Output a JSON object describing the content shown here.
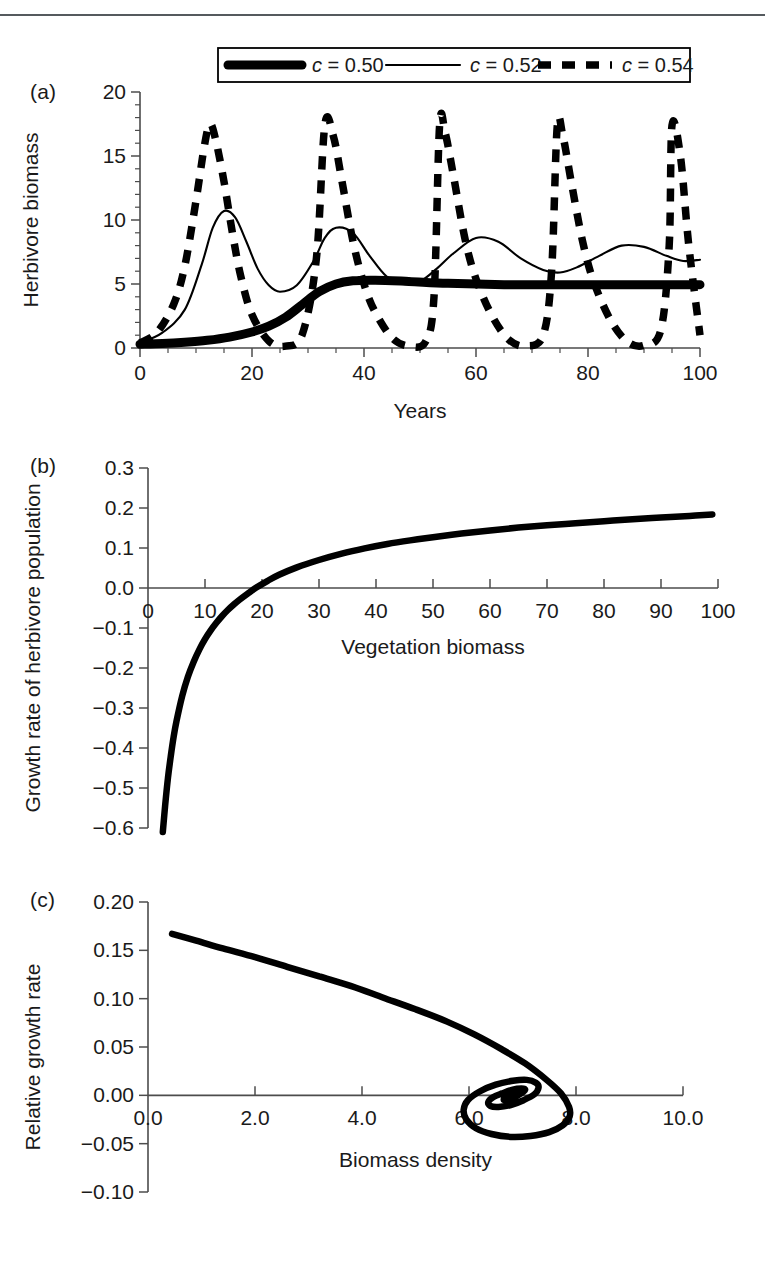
{
  "figure": {
    "panels": [
      {
        "key": "a",
        "label": "(a)"
      },
      {
        "key": "b",
        "label": "(b)"
      },
      {
        "key": "c",
        "label": "(c)"
      }
    ]
  },
  "chart_data": [
    {
      "panel": "(a)",
      "type": "line",
      "title": "",
      "xlabel": "Years",
      "ylabel": "Herbivore biomass",
      "xlim": [
        0,
        100
      ],
      "ylim": [
        0,
        20
      ],
      "xticks": [
        "0",
        "20",
        "40",
        "60",
        "80",
        "100"
      ],
      "xtick_values": [
        0,
        20,
        40,
        60,
        80,
        100
      ],
      "yticks": [
        "0",
        "5",
        "10",
        "15",
        "20"
      ],
      "ytick_values": [
        0,
        5,
        10,
        15,
        20
      ],
      "grid": false,
      "legend_position": "top-center",
      "legend": [
        {
          "label_prefix": "c",
          "label_rest": " = 0.50",
          "style": "thick-solid"
        },
        {
          "label_prefix": "c",
          "label_rest": " = 0.52",
          "style": "thin-solid"
        },
        {
          "label_prefix": "c",
          "label_rest": " = 0.54",
          "style": "dashed"
        }
      ],
      "series": [
        {
          "name": "c = 0.50",
          "style": "thick-solid",
          "description": "Monotone sigmoid rise to a stable equilibrium near 5",
          "x": [
            0,
            4,
            8,
            12,
            16,
            20,
            23,
            26,
            29,
            32,
            35,
            38,
            42,
            48,
            55,
            65,
            75,
            85,
            95,
            100
          ],
          "y": [
            0.3,
            0.35,
            0.45,
            0.6,
            0.85,
            1.25,
            1.7,
            2.4,
            3.4,
            4.4,
            5.0,
            5.25,
            5.3,
            5.2,
            5.05,
            4.95,
            4.95,
            4.95,
            4.95,
            4.95
          ]
        },
        {
          "name": "c = 0.52",
          "style": "thin-solid",
          "description": "Damped oscillation toward equilibrium near 7",
          "x": [
            0,
            4,
            8,
            11,
            13,
            15,
            17,
            19,
            21,
            23,
            25,
            28,
            31,
            33,
            35,
            38,
            41,
            44,
            47,
            50,
            53,
            56,
            60,
            64,
            68,
            72,
            75,
            78,
            82,
            86,
            90,
            94,
            97,
            100
          ],
          "y": [
            0.4,
            1.2,
            3.0,
            6.5,
            9.4,
            10.7,
            10.2,
            8.3,
            6.2,
            4.9,
            4.4,
            4.9,
            6.8,
            8.6,
            9.4,
            9.0,
            7.2,
            5.6,
            5.0,
            5.2,
            6.2,
            7.4,
            8.6,
            8.3,
            7.0,
            6.1,
            5.9,
            6.3,
            7.2,
            8.0,
            7.9,
            7.2,
            6.8,
            6.9
          ]
        },
        {
          "name": "c = 0.54",
          "style": "dashed",
          "description": "Sustained large-amplitude relaxation cycles, peaks near 17.5, troughs near 0, period about 21 years",
          "peaks_x": [
            12.5,
            33,
            53.5,
            74.5,
            95
          ],
          "peak_value": 17.5,
          "trough_value": 0.05,
          "period": 21,
          "x": [
            0,
            3,
            6,
            8,
            10,
            11.5,
            12.5,
            13.5,
            15,
            16.5,
            18,
            20,
            23,
            26,
            29,
            31.5,
            33,
            34.5,
            36,
            38,
            40,
            42,
            45,
            48,
            51,
            52.5,
            53.5,
            54.5,
            56,
            58,
            60,
            63,
            66,
            69,
            72,
            73.5,
            74.5,
            75.5,
            77,
            79,
            81,
            84,
            87,
            90,
            93,
            94.5,
            95,
            96.5,
            98,
            100
          ],
          "y": [
            0.4,
            1.2,
            3.4,
            6.4,
            11.5,
            15.8,
            17.5,
            16.3,
            13.0,
            9.0,
            5.6,
            2.6,
            0.55,
            0.15,
            1.1,
            7.0,
            17.4,
            16.6,
            13.2,
            8.4,
            5.0,
            2.8,
            0.8,
            0.15,
            0.5,
            4.0,
            17.4,
            16.8,
            13.4,
            8.6,
            5.4,
            2.4,
            0.6,
            0.15,
            1.0,
            6.0,
            17.3,
            16.6,
            13.0,
            8.4,
            5.2,
            2.2,
            0.5,
            0.2,
            1.4,
            8.0,
            17.4,
            15.0,
            8.0,
            1.0
          ]
        }
      ]
    },
    {
      "panel": "(b)",
      "type": "line",
      "title": "",
      "xlabel": "Vegetation biomass",
      "ylabel": "Growth rate of herbivore population",
      "xlim": [
        0,
        100
      ],
      "ylim": [
        -0.6,
        0.3
      ],
      "xticks": [
        "0",
        "10",
        "20",
        "30",
        "40",
        "50",
        "60",
        "70",
        "80",
        "90",
        "100"
      ],
      "xtick_values": [
        0,
        10,
        20,
        30,
        40,
        50,
        60,
        70,
        80,
        90,
        100
      ],
      "yticks": [
        "0.3",
        "0.2",
        "0.1",
        "0.0",
        "-0.1",
        "-0.2",
        "-0.3",
        "-0.4",
        "-0.5",
        "-0.6"
      ],
      "ytick_values": [
        0.3,
        0.2,
        0.1,
        0.0,
        -0.1,
        -0.2,
        -0.3,
        -0.4,
        -0.5,
        -0.6
      ],
      "grid": false,
      "zero_crossing_x": 17.5,
      "asymptote_y": 0.205,
      "series": [
        {
          "name": "Per-capita growth rate (saturating functional response minus mortality)",
          "style": "thick-solid",
          "x": [
            2.6,
            3,
            3.5,
            4,
            4.5,
            5,
            6,
            7,
            8,
            9,
            10,
            11,
            12,
            13,
            14,
            15,
            16,
            17.5,
            19,
            21,
            23,
            26,
            30,
            34,
            38,
            42,
            46,
            50,
            55,
            60,
            65,
            70,
            75,
            80,
            85,
            90,
            95,
            99
          ],
          "y": [
            -0.61,
            -0.545,
            -0.475,
            -0.42,
            -0.372,
            -0.333,
            -0.27,
            -0.222,
            -0.185,
            -0.154,
            -0.128,
            -0.106,
            -0.087,
            -0.07,
            -0.055,
            -0.042,
            -0.03,
            -0.014,
            0.001,
            0.018,
            0.033,
            0.051,
            0.07,
            0.086,
            0.099,
            0.11,
            0.119,
            0.127,
            0.136,
            0.144,
            0.151,
            0.157,
            0.162,
            0.167,
            0.172,
            0.176,
            0.18,
            0.184
          ]
        }
      ]
    },
    {
      "panel": "(c)",
      "type": "line",
      "title": "",
      "xlabel": "Biomass density",
      "ylabel": "Relative growth rate",
      "xlim": [
        0,
        10
      ],
      "ylim": [
        -0.1,
        0.2
      ],
      "xticks": [
        "0.0",
        "2.0",
        "4.0",
        "6.0",
        "8.0",
        "10.0"
      ],
      "xtick_values": [
        0,
        2,
        4,
        6,
        8,
        10
      ],
      "yticks": [
        "0.20",
        "0.15",
        "0.10",
        "0.05",
        "0.00",
        "-0.05",
        "-0.10"
      ],
      "ytick_values": [
        0.2,
        0.15,
        0.1,
        0.05,
        0.0,
        -0.05,
        -0.1
      ],
      "grid": false,
      "equilibrium_point": [
        6.85,
        0.0
      ],
      "start_point": [
        0.45,
        0.167
      ],
      "series": [
        {
          "name": "Damped clockwise spiral trajectory converging on stable equilibrium",
          "style": "thick-solid",
          "description": "Trajectory begins upper-left at (0.45, 0.167), descends to the right, loops clockwise with shrinking radius into the focus at (6.85, 0.00)",
          "x": [
            0.45,
            0.9,
            1.4,
            2.0,
            2.6,
            3.2,
            3.8,
            4.4,
            5.0,
            5.6,
            6.1,
            6.6,
            7.05,
            7.45,
            7.72,
            7.87,
            7.88,
            7.75,
            7.5,
            7.15,
            6.78,
            6.42,
            6.13,
            5.95,
            5.9,
            5.98,
            6.2,
            6.5,
            6.82,
            7.08,
            7.25,
            7.3,
            7.22,
            7.02,
            6.78,
            6.55,
            6.4,
            6.36,
            6.45,
            6.62,
            6.82,
            6.98,
            7.05,
            7.0,
            6.88,
            6.75,
            6.66,
            6.66,
            6.74,
            6.85,
            6.94,
            6.97,
            6.92,
            6.84,
            6.78,
            6.78,
            6.83,
            6.88,
            6.9,
            6.87,
            6.84,
            6.85,
            6.86
          ],
          "y": [
            0.167,
            0.16,
            0.152,
            0.143,
            0.133,
            0.123,
            0.113,
            0.101,
            0.089,
            0.076,
            0.063,
            0.048,
            0.033,
            0.016,
            0.002,
            -0.012,
            -0.022,
            -0.031,
            -0.038,
            -0.042,
            -0.043,
            -0.04,
            -0.034,
            -0.025,
            -0.015,
            -0.005,
            0.004,
            0.011,
            0.015,
            0.016,
            0.013,
            0.008,
            0.001,
            -0.005,
            -0.01,
            -0.012,
            -0.011,
            -0.007,
            -0.002,
            0.002,
            0.006,
            0.007,
            0.006,
            0.003,
            -0.001,
            -0.004,
            -0.005,
            -0.003,
            0.0,
            0.003,
            0.004,
            0.004,
            0.002,
            -0.001,
            -0.002,
            -0.002,
            -0.001,
            0.001,
            0.002,
            0.002,
            0.001,
            0.0,
            0.0
          ]
        }
      ]
    }
  ]
}
